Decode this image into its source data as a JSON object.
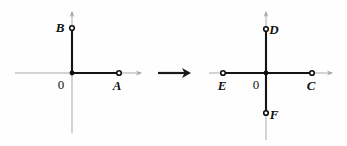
{
  "figure": {
    "background_color": "#fefefe",
    "ink_color": "#111111",
    "axis_color": "#a9a9a9",
    "width": 347,
    "height": 146,
    "transition_symbol": "arrow-right"
  },
  "left_diagram": {
    "name": "before",
    "origin_label": "0",
    "origin": {
      "x": 72,
      "y": 73
    },
    "axes": {
      "horizontal": {
        "x1": 15,
        "y1": 73,
        "x2": 141,
        "y2": 73
      },
      "vertical": {
        "x1": 72,
        "y1": 12,
        "x2": 72,
        "y2": 133
      }
    },
    "points": [
      {
        "label": "B",
        "x": 72,
        "y": 28,
        "label_x": 60,
        "label_y": 32,
        "marker": "ring"
      },
      {
        "label": "A",
        "x": 119,
        "y": 73,
        "label_x": 114,
        "label_y": 90,
        "marker": "ring"
      }
    ],
    "segments": [
      {
        "from": "origin",
        "to": "B",
        "x1": 72,
        "y1": 73,
        "x2": 72,
        "y2": 28
      },
      {
        "from": "origin",
        "to": "A",
        "x1": 72,
        "y1": 73,
        "x2": 119,
        "y2": 73
      }
    ],
    "origin_label_x": 57,
    "origin_label_y": 89
  },
  "arrow": {
    "name": "maps-to-arrow",
    "glyph": "→",
    "x1": 158,
    "y1": 73,
    "x2": 190,
    "y2": 73
  },
  "right_diagram": {
    "name": "after",
    "origin_label": "0",
    "origin": {
      "x": 266,
      "y": 73
    },
    "axes": {
      "horizontal": {
        "x1": 209,
        "y1": 73,
        "x2": 332,
        "y2": 73
      },
      "vertical": {
        "x1": 266,
        "y1": 12,
        "x2": 266,
        "y2": 140
      }
    },
    "points": [
      {
        "label": "D",
        "x": 266,
        "y": 29,
        "label_x": 271,
        "label_y": 34,
        "marker": "ring"
      },
      {
        "label": "C",
        "x": 312,
        "y": 73,
        "label_x": 307,
        "label_y": 90,
        "marker": "ring"
      },
      {
        "label": "E",
        "x": 223,
        "y": 73,
        "label_x": 218,
        "label_y": 90,
        "marker": "ring"
      },
      {
        "label": "F",
        "x": 266,
        "y": 113,
        "label_x": 271,
        "label_y": 119,
        "marker": "ring"
      }
    ],
    "segments": [
      {
        "from": "origin",
        "to": "D",
        "x1": 266,
        "y1": 73,
        "x2": 266,
        "y2": 29
      },
      {
        "from": "origin",
        "to": "C",
        "x1": 266,
        "y1": 73,
        "x2": 312,
        "y2": 73
      },
      {
        "from": "origin",
        "to": "E",
        "x1": 266,
        "y1": 73,
        "x2": 223,
        "y2": 73
      },
      {
        "from": "origin",
        "to": "F",
        "x1": 266,
        "y1": 73,
        "x2": 266,
        "y2": 113
      }
    ],
    "origin_label_x": 252,
    "origin_label_y": 89
  }
}
